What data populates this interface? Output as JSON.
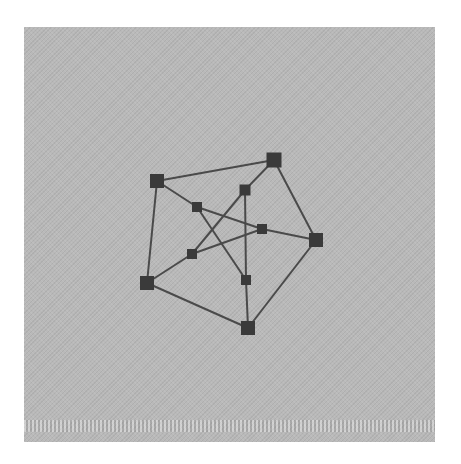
{
  "diagram": {
    "type": "graph",
    "name": "Petersen graph",
    "colors": {
      "background": "#b9b9b9",
      "node": "#3a3a3a",
      "edge": "#4a4a4a"
    },
    "nodes": [
      {
        "id": "A",
        "x": 157,
        "y": 181,
        "size": 14,
        "ring": "outer"
      },
      {
        "id": "B",
        "x": 274,
        "y": 160,
        "size": 15,
        "ring": "outer"
      },
      {
        "id": "C",
        "x": 316,
        "y": 240,
        "size": 14,
        "ring": "outer"
      },
      {
        "id": "D",
        "x": 248,
        "y": 328,
        "size": 14,
        "ring": "outer"
      },
      {
        "id": "E",
        "x": 147,
        "y": 283,
        "size": 14,
        "ring": "outer"
      },
      {
        "id": "a",
        "x": 197,
        "y": 207,
        "size": 10,
        "ring": "inner"
      },
      {
        "id": "b",
        "x": 245,
        "y": 190,
        "size": 11,
        "ring": "inner"
      },
      {
        "id": "c",
        "x": 262,
        "y": 229,
        "size": 10,
        "ring": "inner"
      },
      {
        "id": "d",
        "x": 246,
        "y": 280,
        "size": 10,
        "ring": "inner"
      },
      {
        "id": "e",
        "x": 192,
        "y": 254,
        "size": 10,
        "ring": "inner"
      }
    ],
    "edges": [
      [
        "A",
        "B"
      ],
      [
        "B",
        "C"
      ],
      [
        "C",
        "D"
      ],
      [
        "D",
        "E"
      ],
      [
        "E",
        "A"
      ],
      [
        "A",
        "a"
      ],
      [
        "B",
        "b"
      ],
      [
        "C",
        "c"
      ],
      [
        "D",
        "d"
      ],
      [
        "E",
        "e"
      ],
      [
        "a",
        "c"
      ],
      [
        "c",
        "e"
      ],
      [
        "e",
        "b"
      ],
      [
        "b",
        "d"
      ],
      [
        "d",
        "a"
      ]
    ]
  }
}
